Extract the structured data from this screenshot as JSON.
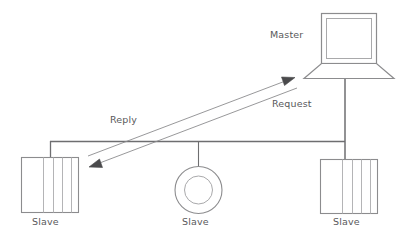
{
  "diagram": {
    "nodes": {
      "master": {
        "label": "Master",
        "icon": "laptop-icon",
        "shape": "laptop"
      },
      "slave_left": {
        "label": "Slave",
        "icon": "striped-box-icon",
        "shape": "striped-rectangle"
      },
      "slave_middle": {
        "label": "Slave",
        "icon": "ring-icon",
        "shape": "annulus"
      },
      "slave_right": {
        "label": "Slave",
        "icon": "striped-box-icon",
        "shape": "striped-rectangle"
      }
    },
    "arrows": {
      "request": {
        "label": "Request",
        "direction": "slave-left-to-master",
        "head": "up-right"
      },
      "reply": {
        "label": "Reply",
        "direction": "master-to-slave-left",
        "head": "down-left"
      }
    },
    "colors": {
      "stroke": "#8c8c8e",
      "bus_stroke": "#6e6e70",
      "text": "#59595b",
      "background": "#ffffff"
    }
  }
}
